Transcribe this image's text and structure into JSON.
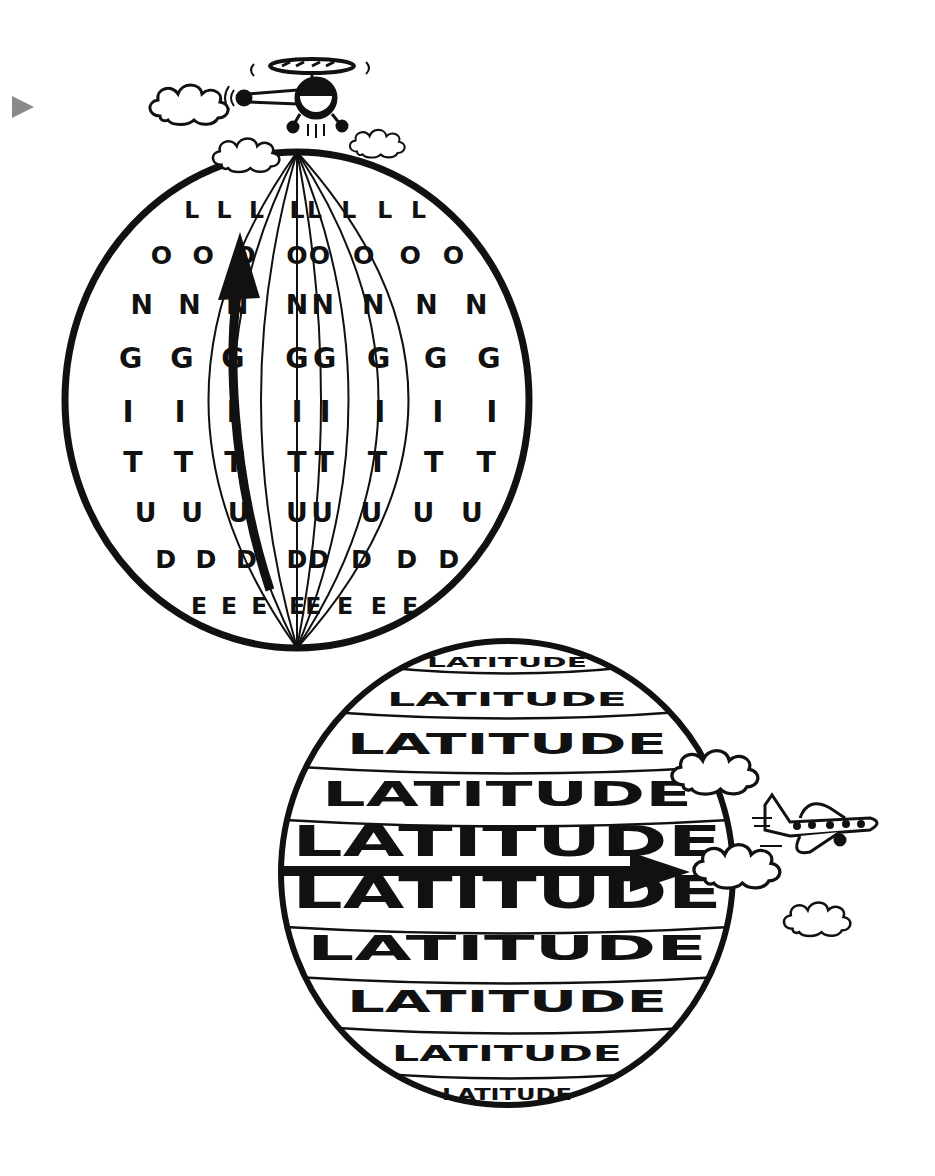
{
  "marker": {
    "icon": "play-triangle-icon",
    "color": "#8a8a8a"
  },
  "longitude_globe": {
    "word": "LONGITUDE",
    "letters": [
      "L",
      "O",
      "N",
      "G",
      "I",
      "T",
      "U",
      "D",
      "E"
    ],
    "strip_count": 8,
    "arrow_direction": "north"
  },
  "latitude_globe": {
    "word": "LATITUDE",
    "rows": [
      "LATITUDE",
      "LATITUDE",
      "LATITUDE",
      "LATITUDE",
      "LATITUDE",
      "LATITUDE",
      "LATITUDE",
      "LATITUDE",
      "LATITUDE",
      "LATITUDE"
    ],
    "arrow_direction": "east"
  },
  "decorations": {
    "helicopter": "helicopter-icon",
    "airplane": "airplane-icon",
    "clouds": 6
  },
  "colors": {
    "ink": "#111111",
    "background": "#ffffff",
    "marker": "#8a8a8a"
  }
}
